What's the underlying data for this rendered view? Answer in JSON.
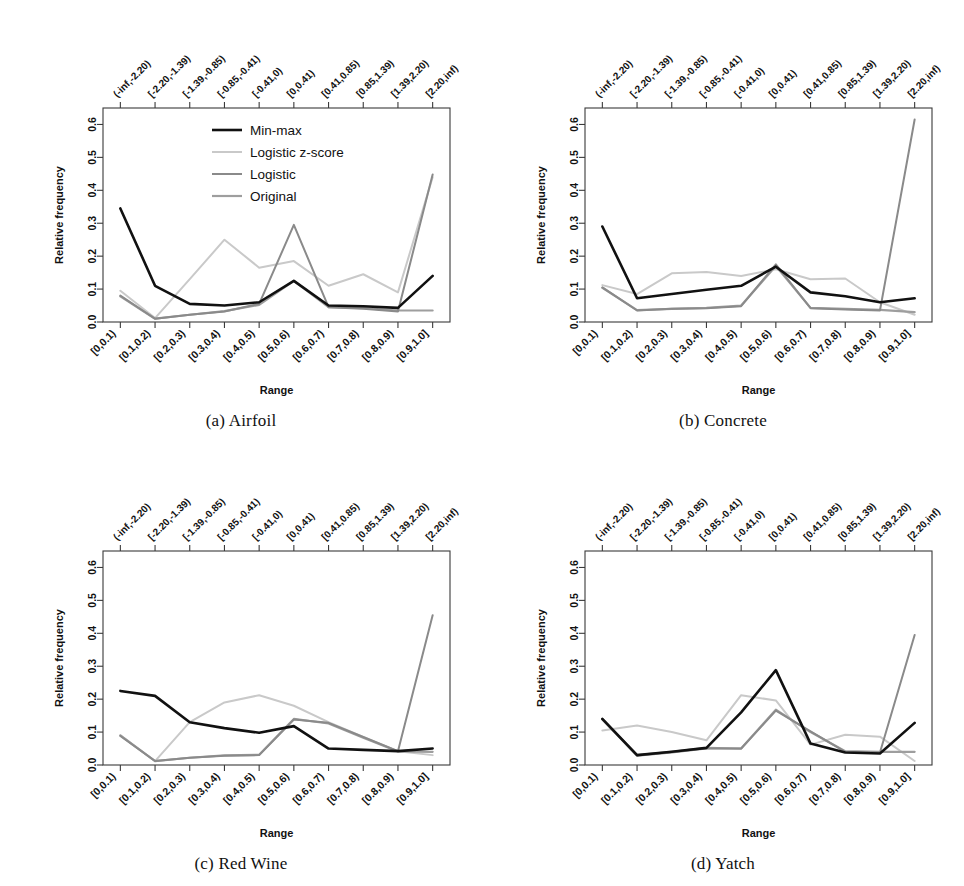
{
  "figure": {
    "axis": {
      "ylabel": "Relative frequency",
      "xlabel": "Range",
      "yticks": [
        "0.0",
        "0.1",
        "0.2",
        "0.3",
        "0.4",
        "0.5",
        "0.6"
      ],
      "ylim": [
        0.0,
        0.65
      ],
      "bottom_categories": [
        "[0,0.1)",
        "[0.1,0.2)",
        "[0.2,0.3)",
        "[0.3,0.4)",
        "[0.4,0.5)",
        "[0.5,0.6)",
        "[0.6,0.7)",
        "[0.7,0.8)",
        "[0.8,0.9)",
        "[0.9,1.0]"
      ],
      "top_categories": [
        "(-inf,-2.20)",
        "[-2.20,-1.39)",
        "[-1.39,-0.85)",
        "[-0.85,-0.41)",
        "[-0.41,0)",
        "[0,0.41)",
        "[0.41,0.85)",
        "[0.85,1.39)",
        "[1.39,2.20)",
        "[2.20,inf)"
      ]
    },
    "legend": {
      "position": "top-center",
      "entries": [
        {
          "label": "Min-max",
          "color": "#111111",
          "width": 2.6
        },
        {
          "label": "Logistic z-score",
          "color": "#c9c9c9",
          "width": 2.0
        },
        {
          "label": "Logistic",
          "color": "#8a8a8a",
          "width": 2.0
        },
        {
          "label": "Original",
          "color": "#9e9e9e",
          "width": 2.2
        }
      ]
    },
    "captions": {
      "a": "(a) Airfoil",
      "b": "(b) Concrete",
      "c": "(c) Red Wine",
      "d": "(d) Yatch"
    }
  },
  "chart_data": [
    {
      "type": "line",
      "title": "(a) Airfoil",
      "xlabel": "Range",
      "ylabel": "Relative frequency",
      "ylim": [
        0.0,
        0.65
      ],
      "grid": false,
      "legend_position": "top-center",
      "categories": [
        "[0,0.1)",
        "[0.1,0.2)",
        "[0.2,0.3)",
        "[0.3,0.4)",
        "[0.4,0.5)",
        "[0.5,0.6)",
        "[0.6,0.7)",
        "[0.7,0.8)",
        "[0.8,0.9)",
        "[0.9,1.0]"
      ],
      "top_categories": [
        "(-inf,-2.20)",
        "[-2.20,-1.39)",
        "[-1.39,-0.85)",
        "[-0.85,-0.41)",
        "[-0.41,0)",
        "[0,0.41)",
        "[0.41,0.85)",
        "[0.85,1.39)",
        "[1.39,2.20)",
        "[2.20,inf)"
      ],
      "series": [
        {
          "name": "Min-max",
          "color": "#111111",
          "values": [
            0.345,
            0.11,
            0.055,
            0.05,
            0.06,
            0.125,
            0.05,
            0.048,
            0.043,
            0.14
          ]
        },
        {
          "name": "Logistic z-score",
          "color": "#c9c9c9",
          "values": [
            0.095,
            0.012,
            0.13,
            0.25,
            0.165,
            0.185,
            0.11,
            0.145,
            0.09,
            0.44
          ]
        },
        {
          "name": "Logistic",
          "color": "#8a8a8a",
          "values": [
            0.08,
            0.01,
            0.022,
            0.032,
            0.055,
            0.295,
            0.045,
            0.04,
            0.032,
            0.448
          ]
        },
        {
          "name": "Original",
          "color": "#9e9e9e",
          "values": [
            0.078,
            0.01,
            0.022,
            0.033,
            0.052,
            0.125,
            0.045,
            0.042,
            0.035,
            0.035
          ]
        }
      ]
    },
    {
      "type": "line",
      "title": "(b) Concrete",
      "xlabel": "Range",
      "ylabel": "Relative frequency",
      "ylim": [
        0.0,
        0.65
      ],
      "grid": false,
      "legend_position": "none",
      "categories": [
        "[0,0.1)",
        "[0.1,0.2)",
        "[0.2,0.3)",
        "[0.3,0.4)",
        "[0.4,0.5)",
        "[0.5,0.6)",
        "[0.6,0.7)",
        "[0.7,0.8)",
        "[0.8,0.9)",
        "[0.9,1.0]"
      ],
      "top_categories": [
        "(-inf,-2.20)",
        "[-2.20,-1.39)",
        "[-1.39,-0.85)",
        "[-0.85,-0.41)",
        "[-0.41,0)",
        "[0,0.41)",
        "[0.41,0.85)",
        "[0.85,1.39)",
        "[1.39,2.20)",
        "[2.20,inf)"
      ],
      "series": [
        {
          "name": "Min-max",
          "color": "#111111",
          "values": [
            0.29,
            0.072,
            0.085,
            0.098,
            0.11,
            0.168,
            0.09,
            0.078,
            0.06,
            0.072
          ]
        },
        {
          "name": "Logistic z-score",
          "color": "#c9c9c9",
          "values": [
            0.112,
            0.085,
            0.148,
            0.152,
            0.14,
            0.16,
            0.13,
            0.132,
            0.06,
            0.022
          ]
        },
        {
          "name": "Logistic",
          "color": "#8a8a8a",
          "values": [
            0.105,
            0.035,
            0.04,
            0.042,
            0.048,
            0.175,
            0.042,
            0.038,
            0.035,
            0.615
          ]
        },
        {
          "name": "Original",
          "color": "#9e9e9e",
          "values": [
            0.104,
            0.036,
            0.04,
            0.043,
            0.05,
            0.17,
            0.043,
            0.04,
            0.037,
            0.03
          ]
        }
      ]
    },
    {
      "type": "line",
      "title": "(c) Red Wine",
      "xlabel": "Range",
      "ylabel": "Relative frequency",
      "ylim": [
        0.0,
        0.65
      ],
      "grid": false,
      "legend_position": "none",
      "categories": [
        "[0,0.1)",
        "[0.1,0.2)",
        "[0.2,0.3)",
        "[0.3,0.4)",
        "[0.4,0.5)",
        "[0.5,0.6)",
        "[0.6,0.7)",
        "[0.7,0.8)",
        "[0.8,0.9)",
        "[0.9,1.0]"
      ],
      "top_categories": [
        "(-inf,-2.20)",
        "[-2.20,-1.39)",
        "[-1.39,-0.85)",
        "[-0.85,-0.41)",
        "[-0.41,0)",
        "[0,0.41)",
        "[0.41,0.85)",
        "[0.85,1.39)",
        "[1.39,2.20)",
        "[2.20,inf)"
      ],
      "series": [
        {
          "name": "Min-max",
          "color": "#111111",
          "values": [
            0.225,
            0.21,
            0.13,
            0.112,
            0.098,
            0.118,
            0.05,
            0.046,
            0.042,
            0.05
          ]
        },
        {
          "name": "Logistic z-score",
          "color": "#c9c9c9",
          "values": [
            0.09,
            0.012,
            0.13,
            0.19,
            0.212,
            0.18,
            0.13,
            0.085,
            0.042,
            0.03
          ]
        },
        {
          "name": "Logistic",
          "color": "#8a8a8a",
          "values": [
            0.088,
            0.012,
            0.022,
            0.028,
            0.03,
            0.138,
            0.128,
            0.085,
            0.042,
            0.455
          ]
        },
        {
          "name": "Original",
          "color": "#9e9e9e",
          "values": [
            0.09,
            0.012,
            0.022,
            0.029,
            0.031,
            0.14,
            0.126,
            0.083,
            0.041,
            0.04
          ]
        }
      ]
    },
    {
      "type": "line",
      "title": "(d) Yatch",
      "xlabel": "Range",
      "ylabel": "Relative frequency",
      "ylim": [
        0.0,
        0.65
      ],
      "grid": false,
      "legend_position": "none",
      "categories": [
        "[0,0.1)",
        "[0.1,0.2)",
        "[0.2,0.3)",
        "[0.3,0.4)",
        "[0.4,0.5)",
        "[0.5,0.6)",
        "[0.6,0.7)",
        "[0.7,0.8)",
        "[0.8,0.9)",
        "[0.9,1.0]"
      ],
      "top_categories": [
        "(-inf,-2.20)",
        "[-2.20,-1.39)",
        "[-1.39,-0.85)",
        "[-0.85,-0.41)",
        "[-0.41,0)",
        "[0,0.41)",
        "[0.41,0.85)",
        "[0.85,1.39)",
        "[1.39,2.20)",
        "[2.20,inf)"
      ],
      "series": [
        {
          "name": "Min-max",
          "color": "#111111",
          "values": [
            0.14,
            0.03,
            0.04,
            0.052,
            0.16,
            0.288,
            0.065,
            0.038,
            0.035,
            0.128
          ]
        },
        {
          "name": "Logistic z-score",
          "color": "#c9c9c9",
          "values": [
            0.105,
            0.12,
            0.1,
            0.075,
            0.212,
            0.196,
            0.062,
            0.092,
            0.086,
            0.012
          ]
        },
        {
          "name": "Logistic",
          "color": "#8a8a8a",
          "values": [
            0.138,
            0.028,
            0.038,
            0.05,
            0.05,
            0.165,
            0.102,
            0.04,
            0.038,
            0.395
          ]
        },
        {
          "name": "Original",
          "color": "#9e9e9e",
          "values": [
            0.14,
            0.03,
            0.04,
            0.052,
            0.05,
            0.168,
            0.1,
            0.042,
            0.04,
            0.04
          ]
        }
      ]
    }
  ]
}
